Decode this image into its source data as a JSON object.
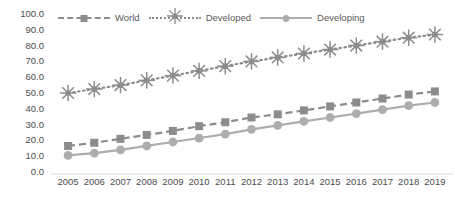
{
  "chart_data": {
    "type": "line",
    "title": "",
    "xlabel": "",
    "ylabel": "",
    "grid": false,
    "legend_position": "top",
    "ylim": [
      0,
      100
    ],
    "ytick_labels": [
      "100.0",
      "90.0",
      "80.0",
      "70.0",
      "60.0",
      "50.0",
      "40.0",
      "30.0",
      "20.0",
      "10.0",
      "0.0"
    ],
    "yticks": [
      100,
      90,
      80,
      70,
      60,
      50,
      40,
      30,
      20,
      10,
      0
    ],
    "categories": [
      "2005",
      "2006",
      "2007",
      "2008",
      "2009",
      "2010",
      "2011",
      "2012",
      "2013",
      "2014",
      "2015",
      "2016",
      "2017",
      "2018",
      "2019"
    ],
    "x": [
      2005,
      2006,
      2007,
      2008,
      2009,
      2010,
      2011,
      2012,
      2013,
      2014,
      2015,
      2016,
      2017,
      2018,
      2019
    ],
    "series": [
      {
        "name": "World",
        "marker": "square",
        "linestyle": "dashed",
        "color": "#8c8c8c",
        "values": [
          16.5,
          18.5,
          21.0,
          23.5,
          26.0,
          29.0,
          31.5,
          34.5,
          36.5,
          39.0,
          41.5,
          44.0,
          46.5,
          49.0,
          51.0
        ]
      },
      {
        "name": "Developed",
        "marker": "star",
        "linestyle": "dotted",
        "color": "#8c8c8c",
        "values": [
          50.0,
          52.5,
          55.0,
          58.0,
          61.0,
          64.0,
          67.0,
          70.0,
          72.5,
          75.0,
          77.5,
          80.0,
          82.5,
          85.0,
          87.0
        ]
      },
      {
        "name": "Developing",
        "marker": "circle",
        "linestyle": "solid",
        "color": "#adadad",
        "values": [
          10.5,
          12.0,
          14.0,
          16.5,
          19.0,
          21.5,
          24.0,
          27.0,
          29.5,
          32.0,
          34.5,
          37.0,
          39.5,
          42.0,
          44.0
        ]
      }
    ]
  },
  "legend": {
    "entries": [
      {
        "label": "World",
        "key": "world"
      },
      {
        "label": "Developed",
        "key": "developed"
      },
      {
        "label": "Developing",
        "key": "developing"
      }
    ]
  },
  "colors": {
    "world": "#8c8c8c",
    "developed": "#8c8c8c",
    "developing": "#adadad",
    "axis": "#d9d9d9",
    "text": "#4d4d4d"
  }
}
